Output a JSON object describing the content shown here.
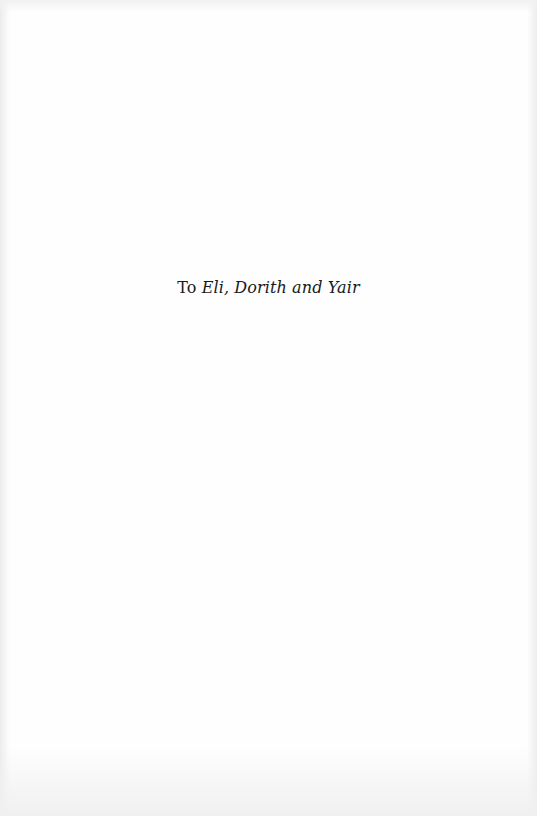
{
  "page": {
    "type": "dedication",
    "background_color": "#fefefe",
    "text_color": "#1a1a1a"
  },
  "dedication": {
    "prefix": "To",
    "names": "Eli, Dorith and Yair"
  }
}
